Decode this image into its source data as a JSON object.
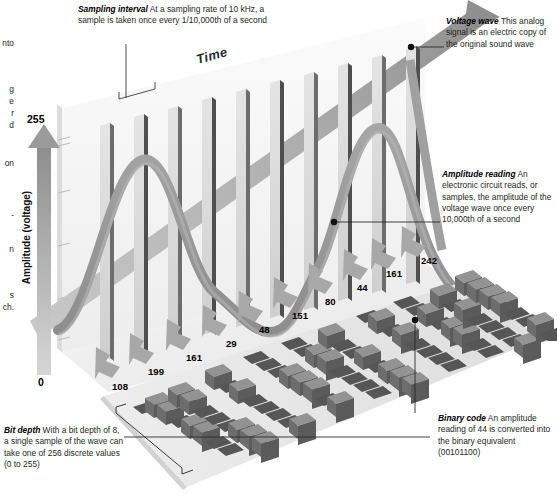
{
  "figure": {
    "type": "infographic",
    "time_axis_label": "Time",
    "amplitude_axis_label": "Amplitude (voltage)",
    "amplitude_max": "255",
    "amplitude_min": "0"
  },
  "annotations": {
    "sampling_interval": {
      "term": "Sampling interval",
      "body": " At a sampling rate of 10 kHz, a sample is taken once every 1/10,000th of a second"
    },
    "voltage_wave": {
      "term": "Voltage wave",
      "body": " This analog signal is an electric copy of the original sound wave"
    },
    "amplitude_reading": {
      "term": "Amplitude reading",
      "body": " An electronic circuit reads, or samples, the amplitude of the voltage wave once every 10,000th of a second"
    },
    "binary_code": {
      "term": "Binary code",
      "body": " An amplitude reading of 44 is converted into the binary equivalent (00101100)"
    },
    "bit_depth": {
      "term": "Bit depth",
      "body": " With a bit depth of 8, a single sample of the wave can take one of 256 discrete values (0 to 255)"
    }
  },
  "gutter_fragments": [
    {
      "text": "nto",
      "top": 38
    },
    {
      "text": "g",
      "top": 84
    },
    {
      "text": "e",
      "top": 96
    },
    {
      "text": "r",
      "top": 108
    },
    {
      "text": "d",
      "top": 120
    },
    {
      "text": "on",
      "top": 158
    },
    {
      "text": "-",
      "top": 210
    },
    {
      "text": "n",
      "top": 244
    },
    {
      "text": "s",
      "top": 290
    },
    {
      "text": "ch.",
      "top": 302
    }
  ],
  "chart_data": {
    "type": "bar",
    "xlabel": "Time",
    "ylabel": "Amplitude (voltage)",
    "ylim": [
      0,
      255
    ],
    "grid": false,
    "legend": "none",
    "categories": [
      "s1",
      "s2",
      "s3",
      "s4",
      "s5",
      "s6",
      "s7",
      "s8",
      "s9",
      "s10"
    ],
    "values": [
      108,
      199,
      161,
      29,
      48,
      151,
      80,
      44,
      161,
      242
    ],
    "binary_values": [
      "01101100",
      "11000111",
      "10100001",
      "00011101",
      "00110000",
      "10010111",
      "01010000",
      "00101100",
      "10100001",
      "11110010"
    ],
    "bit_depth": 8,
    "sampling_rate": "10 kHz",
    "annotation_note": "Analog voltage wave sampled at fixed intervals; each sample quantized to an 8-bit binary code"
  },
  "sample_labels": [
    {
      "value": "108",
      "x": 112,
      "y": 381
    },
    {
      "value": "199",
      "x": 148,
      "y": 366
    },
    {
      "value": "161",
      "x": 186,
      "y": 352
    },
    {
      "value": "29",
      "x": 226,
      "y": 338
    },
    {
      "value": "48",
      "x": 259,
      "y": 324
    },
    {
      "value": "151",
      "x": 292,
      "y": 310
    },
    {
      "value": "80",
      "x": 325,
      "y": 296
    },
    {
      "value": "44",
      "x": 357,
      "y": 282
    },
    {
      "value": "161",
      "x": 386,
      "y": 268
    },
    {
      "value": "242",
      "x": 421,
      "y": 255
    }
  ],
  "colors": {
    "wave": "#9a9a9a",
    "bar_front": "#d8d8d8",
    "bar_side": "#5d5d5d",
    "cube_top": "#8e8e8e",
    "cube_front": "#6f6f6f",
    "cube_side": "#575757",
    "plate": "#e9e9e9",
    "arrow": "#a8a8a8",
    "text": "#231f20"
  }
}
